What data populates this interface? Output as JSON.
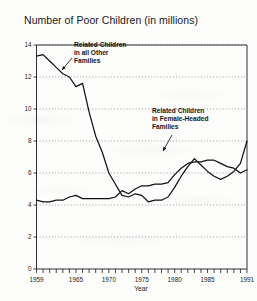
{
  "chart_data": {
    "type": "line",
    "title": "Number of Poor Children (in millions)",
    "xlabel": "Year",
    "ylabel": "",
    "xlim": [
      1959,
      1991
    ],
    "ylim": [
      0,
      14
    ],
    "grid": "horizontal-dotted",
    "legend_position": "inline-annotations",
    "ytick_labels": [
      "0",
      "2",
      "4",
      "6",
      "8",
      "10",
      "12",
      "14"
    ],
    "yticks": [
      0,
      2,
      4,
      6,
      8,
      10,
      12,
      14
    ],
    "xtick_labels": [
      "1959",
      "1965",
      "1970",
      "1975",
      "1980",
      "1985",
      "1991"
    ],
    "xticks": [
      1959,
      1965,
      1970,
      1975,
      1980,
      1985,
      1991
    ],
    "x": [
      1959,
      1960,
      1961,
      1962,
      1963,
      1964,
      1965,
      1966,
      1967,
      1968,
      1969,
      1970,
      1971,
      1972,
      1973,
      1974,
      1975,
      1976,
      1977,
      1978,
      1979,
      1980,
      1981,
      1982,
      1983,
      1984,
      1985,
      1986,
      1987,
      1988,
      1989,
      1990,
      1991
    ],
    "series": [
      {
        "name": "Related Children in all Other Families",
        "annotation": [
          "Related Children",
          "in all Other",
          "Families"
        ],
        "values": [
          13.3,
          13.4,
          13.0,
          12.6,
          12.2,
          12.0,
          11.4,
          11.6,
          9.8,
          8.3,
          7.3,
          6.0,
          5.3,
          4.6,
          4.5,
          4.7,
          4.6,
          4.2,
          4.3,
          4.3,
          4.5,
          5.1,
          5.8,
          6.4,
          6.9,
          6.5,
          6.1,
          5.8,
          5.6,
          5.8,
          6.1,
          6.6,
          8.0
        ]
      },
      {
        "name": "Related Children in Female-Headed Families",
        "annotation": [
          "Related Children",
          "in Female-Headed",
          "Families"
        ],
        "values": [
          4.3,
          4.2,
          4.2,
          4.3,
          4.3,
          4.5,
          4.6,
          4.4,
          4.4,
          4.4,
          4.4,
          4.4,
          4.5,
          4.9,
          4.7,
          5.0,
          5.2,
          5.2,
          5.3,
          5.3,
          5.4,
          5.9,
          6.3,
          6.6,
          6.7,
          6.7,
          6.8,
          6.8,
          6.6,
          6.4,
          6.3,
          6.0,
          6.2
        ]
      }
    ]
  }
}
